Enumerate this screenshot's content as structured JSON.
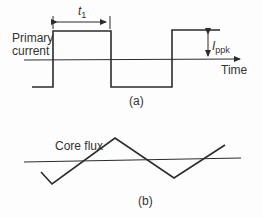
{
  "panel_a": {
    "caption": "(a)",
    "waveform_label_line1": "Primary",
    "waveform_label_line2": "current",
    "axis_label": "Time",
    "period_label_main": "t",
    "period_label_sub": "1",
    "amplitude_label_main": "I",
    "amplitude_label_sub": "ppk",
    "waveform_type": "square wave"
  },
  "panel_b": {
    "caption": "(b)",
    "waveform_label": "Core flux",
    "waveform_type": "triangle wave"
  },
  "colors": {
    "stroke": "#2b2b2b",
    "text": "#333333",
    "background": "#fdfdfd"
  }
}
